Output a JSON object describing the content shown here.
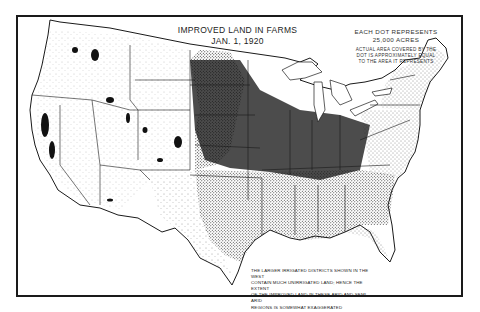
{
  "map": {
    "title_line1": "IMPROVED LAND IN FARMS",
    "title_line2": "JAN. 1, 1920",
    "legend": {
      "line1": "EACH DOT REPRESENTS",
      "line2": "25,000 ACRES",
      "line3": "ACTUAL AREA COVERED BY THE",
      "line4": "DOT IS APPROXIMATELY EQUAL",
      "line5": "TO THE AREA IT REPRESENTS"
    },
    "note": {
      "line1": "THE LARGER IRRIGATED DISTRICTS SHOWN IN THE WEST",
      "line2": "CONTAIN MUCH UNIRRIGATED LAND; HENCE THE EXTENT",
      "line3": "OF THE IMPROVED LAND IN THESE ARID AND SEMI-ARID",
      "line4": "REGIONS IS SOMEWHAT EXAGGERATED"
    },
    "region": "United States",
    "type": "dot-density",
    "colors": {
      "ink": "#1a1a1a",
      "paper": "#ffffff"
    }
  }
}
